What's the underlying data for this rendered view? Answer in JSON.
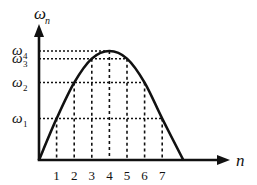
{
  "chart_data": {
    "type": "line",
    "title": "",
    "xlabel": "n",
    "ylabel": "ω_n",
    "ylabel_main": "ω",
    "ylabel_sub": "n",
    "x_ticks": [
      "1",
      "2",
      "3",
      "4",
      "5",
      "6",
      "7"
    ],
    "x_tick_values": [
      1,
      2,
      3,
      4,
      5,
      6,
      7
    ],
    "y_levels": [
      {
        "name": "ω1",
        "main": "ω",
        "sub": "1",
        "value": 0.38,
        "x_indices": [
          1,
          7
        ]
      },
      {
        "name": "ω2",
        "main": "ω",
        "sub": "2",
        "value": 0.71,
        "x_indices": [
          2,
          6
        ]
      },
      {
        "name": "ω3",
        "main": "ω",
        "sub": "3",
        "value": 0.93,
        "x_indices": [
          3,
          5
        ]
      },
      {
        "name": "ω4",
        "main": "ω",
        "sub": "4",
        "value": 1.0,
        "x_indices": [
          4
        ]
      }
    ],
    "curve": {
      "description": "parabolic curve starting at origin, peak at n=4 (ω4), returning to zero near n≈8.2",
      "points": [
        {
          "x": 0,
          "y": 0
        },
        {
          "x": 1,
          "y": 0.38
        },
        {
          "x": 2,
          "y": 0.71
        },
        {
          "x": 3,
          "y": 0.93
        },
        {
          "x": 4,
          "y": 1.0
        },
        {
          "x": 5,
          "y": 0.93
        },
        {
          "x": 6,
          "y": 0.71
        },
        {
          "x": 7,
          "y": 0.38
        },
        {
          "x": 8.2,
          "y": 0
        }
      ]
    },
    "xlim": [
      0,
      11
    ],
    "ylim": [
      0,
      1.3
    ],
    "grid": false,
    "guide_lines": "dotted",
    "legend": "none"
  }
}
